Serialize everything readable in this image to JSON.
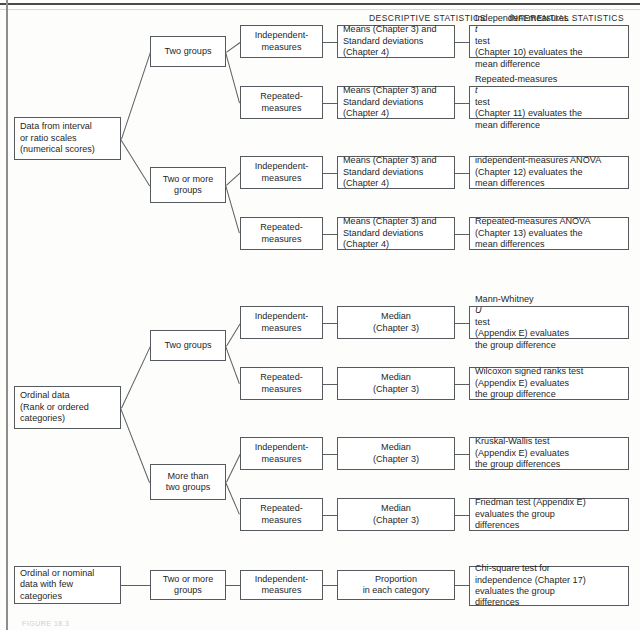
{
  "figure": {
    "caption": "FIGURE 18.3",
    "headers": {
      "descriptive": "DESCRIPTIVE STATISTICS",
      "inferential": "INFERENTIAL STATISTICS"
    }
  },
  "sections": [
    {
      "id": "interval-ratio",
      "root": "Data from interval\nor ratio scales\n(numerical scores)",
      "branches": [
        {
          "label": "Two groups",
          "designs": [
            {
              "design": "Independent-\nmeasures",
              "descriptive": "Means (Chapter 3) and\nStandard deviations\n(Chapter 4)",
              "inferential": "Independent-measures t test\n(Chapter 10) evaluates the\nmean difference"
            },
            {
              "design": "Repeated-\nmeasures",
              "descriptive": "Means (Chapter 3) and\nStandard deviations\n(Chapter 4)",
              "inferential": "Repeated-measures t test\n(Chapter 11) evaluates the\nmean difference"
            }
          ]
        },
        {
          "label": "Two or more\ngroups",
          "designs": [
            {
              "design": "Independent-\nmeasures",
              "descriptive": "Means (Chapter 3) and\nStandard deviations\n(Chapter 4)",
              "inferential": "independent-measures ANOVA\n(Chapter 12) evaluates the\nmean differences"
            },
            {
              "design": "Repeated-\nmeasures",
              "descriptive": "Means (Chapter 3) and\nStandard deviations\n(Chapter 4)",
              "inferential": "Repeated-measures ANOVA\n(Chapter 13) evaluates the\nmean differences"
            }
          ]
        }
      ]
    },
    {
      "id": "ordinal",
      "root": "Ordinal data\n(Rank or ordered\ncategories)",
      "branches": [
        {
          "label": "Two groups",
          "designs": [
            {
              "design": "Independent-\nmeasures",
              "descriptive": "Median\n(Chapter 3)",
              "inferential": "Mann-Whitney U test\n(Appendix E) evaluates\nthe group difference"
            },
            {
              "design": "Repeated-\nmeasures",
              "descriptive": "Median\n(Chapter 3)",
              "inferential": "Wilcoxon signed ranks test\n(Appendix E) evaluates\nthe group difference"
            }
          ]
        },
        {
          "label": "More than\ntwo groups",
          "designs": [
            {
              "design": "Independent-\nmeasures",
              "descriptive": "Median\n(Chapter 3)",
              "inferential": "Kruskal-Wallis test\n(Appendix E) evaluates\nthe group differences"
            },
            {
              "design": "Repeated-\nmeasures",
              "descriptive": "Median\n(Chapter 3)",
              "inferential": "Friedman test (Appendix E)\nevaluates the group\ndifferences"
            }
          ]
        }
      ]
    },
    {
      "id": "nominal",
      "root": "Ordinal or nominal\ndata with few\ncategories",
      "branches": [
        {
          "label": "Two or more\ngroups",
          "designs": [
            {
              "design": "Independent-\nmeasures",
              "descriptive": "Proportion\nin each category",
              "inferential": "Chi-square test for\nindependence (Chapter 17)\nevaluates the group\ndifferences"
            }
          ]
        }
      ]
    }
  ]
}
